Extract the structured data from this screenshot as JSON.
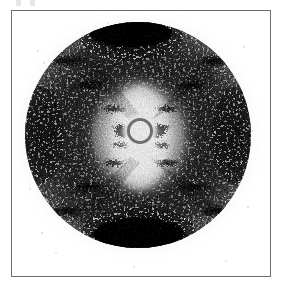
{
  "figure": {
    "kind": "x-ray-fiber-diffraction-photograph",
    "caption": "",
    "width_px": 291,
    "height_px": 285,
    "background_color": "#ffffff"
  },
  "plate": {
    "name": "photographic-film-plate",
    "frame_color": "#6e6e6e",
    "frame_border_px": 1,
    "left_px": 11,
    "top_px": 10,
    "width_px": 260,
    "height_px": 267,
    "interior_color": "#ffffff"
  },
  "crop_marks": {
    "name": "top-edge-registration-marks",
    "count": 2,
    "color": "#aeaeae",
    "opacity": "0.30"
  },
  "pattern": {
    "center_x_px": 136,
    "center_y_px": 133,
    "film_radius_px": 113,
    "film_base_gray": "#8c8c8c",
    "grain_description": "heavy photographic silver-halide grain, high contrast black speckle on white",
    "halo_inner_radius_px": 34,
    "halo_outer_radius_px": 104,
    "beamstop": {
      "name": "beamstop-shadow",
      "center_x_px": 136,
      "center_y_px": 130,
      "disc_radius_px": 11,
      "ring_radius_px": 13,
      "disc_color": "#ffffff",
      "ring_color": "#1a1a1a"
    },
    "meridional_arcs": [
      {
        "label": "top-meridional-reflection",
        "center_x_px": 129,
        "center_y_px": 32,
        "rx_px": 42,
        "ry_px": 16,
        "color": "#000000"
      },
      {
        "label": "bottom-meridional-reflection",
        "center_x_px": 137,
        "center_y_px": 233,
        "rx_px": 47,
        "ry_px": 18,
        "color": "#000000"
      }
    ],
    "equatorial_lobes": [
      {
        "label": "left-equatorial-lobe",
        "center_x_px": 36,
        "center_y_px": 133,
        "rx_px": 26,
        "ry_px": 52,
        "color": "#2b2b2b"
      },
      {
        "label": "right-equatorial-lobe",
        "center_x_px": 236,
        "center_y_px": 133,
        "rx_px": 26,
        "ry_px": 52,
        "color": "#2b2b2b"
      }
    ],
    "helix_cross": {
      "label": "x-pattern-layer-lines",
      "description": "Characteristic X-shaped array of layer-line reflections indicating a helical structure",
      "arm_angle_deg": 52,
      "arms": 4,
      "layer_line_count_per_arm": 4,
      "spot_color": "#141414"
    },
    "layer_line_spots": [
      {
        "label": "L1-left-upper",
        "cx": 110,
        "cy": 106,
        "rx": 13,
        "ry": 4
      },
      {
        "label": "L1-right-upper",
        "cx": 165,
        "cy": 106,
        "rx": 13,
        "ry": 4
      },
      {
        "label": "L1-left-lower",
        "cx": 110,
        "cy": 160,
        "rx": 13,
        "ry": 4
      },
      {
        "label": "L1-right-lower",
        "cx": 165,
        "cy": 160,
        "rx": 13,
        "ry": 4
      },
      {
        "label": "L2-left-upper",
        "cx": 86,
        "cy": 80,
        "rx": 15,
        "ry": 5
      },
      {
        "label": "L2-right-upper",
        "cx": 189,
        "cy": 80,
        "rx": 15,
        "ry": 5
      },
      {
        "label": "L2-left-lower",
        "cx": 84,
        "cy": 186,
        "rx": 16,
        "ry": 5
      },
      {
        "label": "L2-right-lower",
        "cx": 191,
        "cy": 186,
        "rx": 16,
        "ry": 5
      },
      {
        "label": "L3-left-upper",
        "cx": 62,
        "cy": 56,
        "rx": 17,
        "ry": 6
      },
      {
        "label": "L3-right-upper",
        "cx": 212,
        "cy": 56,
        "rx": 17,
        "ry": 6
      },
      {
        "label": "L3-left-lower",
        "cx": 60,
        "cy": 210,
        "rx": 18,
        "ry": 6
      },
      {
        "label": "L3-right-lower",
        "cx": 214,
        "cy": 210,
        "rx": 18,
        "ry": 6
      }
    ]
  }
}
